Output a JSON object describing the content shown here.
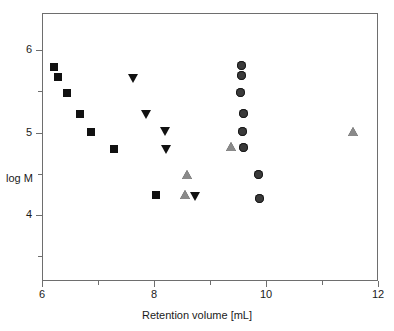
{
  "chart_data": {
    "type": "scatter",
    "title": "",
    "xlabel": "Retention volume [mL]",
    "ylabel": "log M",
    "xlim": [
      6,
      12
    ],
    "ylim": [
      3.2,
      6.45
    ],
    "grid": false,
    "legend": "none",
    "x_ticks": [
      {
        "value": 6,
        "label": "6",
        "major": true
      },
      {
        "value": 7,
        "label": "",
        "major": false
      },
      {
        "value": 8,
        "label": "8",
        "major": true
      },
      {
        "value": 9,
        "label": "",
        "major": false
      },
      {
        "value": 10,
        "label": "10",
        "major": true
      },
      {
        "value": 11,
        "label": "",
        "major": false
      },
      {
        "value": 12,
        "label": "12",
        "major": true
      }
    ],
    "y_ticks": [
      {
        "value": 6,
        "label": "6",
        "major": true
      },
      {
        "value": 5.5,
        "label": "",
        "major": false
      },
      {
        "value": 5,
        "label": "5",
        "major": true
      },
      {
        "value": 4.5,
        "label": "",
        "major": false
      },
      {
        "value": 4,
        "label": "4",
        "major": true
      },
      {
        "value": 3.5,
        "label": "",
        "major": false
      }
    ],
    "series": [
      {
        "name": "squares",
        "marker": "square",
        "color": "#111111",
        "points": [
          {
            "x": 6.21,
            "y": 5.79
          },
          {
            "x": 6.28,
            "y": 5.67
          },
          {
            "x": 6.44,
            "y": 5.48
          },
          {
            "x": 6.67,
            "y": 5.23
          },
          {
            "x": 6.88,
            "y": 5.01
          },
          {
            "x": 7.28,
            "y": 4.8
          },
          {
            "x": 8.04,
            "y": 4.24
          }
        ]
      },
      {
        "name": "down-triangles",
        "marker": "triangle-down",
        "color": "#111111",
        "points": [
          {
            "x": 7.63,
            "y": 5.66
          },
          {
            "x": 7.86,
            "y": 5.23
          },
          {
            "x": 8.19,
            "y": 5.02
          },
          {
            "x": 8.21,
            "y": 4.8
          },
          {
            "x": 8.74,
            "y": 4.23
          }
        ]
      },
      {
        "name": "up-triangles",
        "marker": "triangle-up",
        "color": "#8a8a8a",
        "points": [
          {
            "x": 8.58,
            "y": 4.49
          },
          {
            "x": 8.56,
            "y": 4.24
          },
          {
            "x": 9.37,
            "y": 4.82
          },
          {
            "x": 11.55,
            "y": 5.01
          }
        ]
      },
      {
        "name": "circles",
        "marker": "circle",
        "color": "#3a3a3a",
        "points": [
          {
            "x": 9.57,
            "y": 5.81
          },
          {
            "x": 9.57,
            "y": 5.69
          },
          {
            "x": 9.55,
            "y": 5.49
          },
          {
            "x": 9.6,
            "y": 5.23
          },
          {
            "x": 9.58,
            "y": 5.01
          },
          {
            "x": 9.59,
            "y": 4.82
          },
          {
            "x": 9.86,
            "y": 4.49
          },
          {
            "x": 9.88,
            "y": 4.2
          }
        ]
      }
    ]
  },
  "axes": {
    "x_title": "Retention volume [mL]",
    "y_title": "log M"
  }
}
